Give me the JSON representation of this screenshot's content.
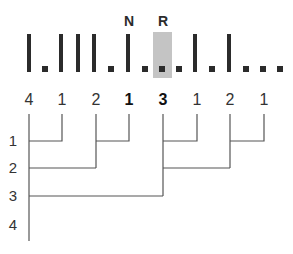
{
  "sequence": {
    "highlight_color": "#c4c4c4",
    "ink_color": "#2b2b2b",
    "markers": [
      {
        "label": "N",
        "x": 129
      },
      {
        "label": "R",
        "x": 163
      }
    ],
    "bars_x": [
      29,
      61,
      78,
      94,
      128,
      195,
      229
    ],
    "dots_x": [
      45,
      111,
      145,
      162,
      179,
      212,
      246,
      263,
      280
    ],
    "highlighted_dot_x": 162
  },
  "counts": [
    {
      "value": "4",
      "x": 29,
      "bold": false
    },
    {
      "value": "1",
      "x": 62,
      "bold": false
    },
    {
      "value": "2",
      "x": 96,
      "bold": false
    },
    {
      "value": "1",
      "x": 129,
      "bold": true
    },
    {
      "value": "3",
      "x": 163,
      "bold": true
    },
    {
      "value": "1",
      "x": 197,
      "bold": false
    },
    {
      "value": "2",
      "x": 230,
      "bold": false
    },
    {
      "value": "1",
      "x": 264,
      "bold": false
    }
  ],
  "levels": [
    {
      "value": "1",
      "y": 141
    },
    {
      "value": "2",
      "y": 168
    },
    {
      "value": "3",
      "y": 196
    },
    {
      "value": "4",
      "y": 225
    }
  ],
  "tree": {
    "line_color": "#555555",
    "stem_top": 114,
    "axis_bottom": 241
  }
}
